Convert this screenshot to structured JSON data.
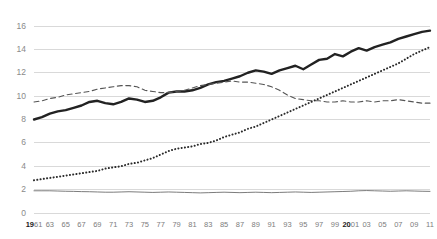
{
  "chart_data": {
    "type": "line",
    "title": "",
    "subtitle": "",
    "xlabel": "",
    "ylabel": "",
    "xlim": [
      1961,
      2011
    ],
    "ylim": [
      0,
      17
    ],
    "yticks": [
      0,
      2,
      4,
      6,
      8,
      10,
      12,
      14,
      16
    ],
    "ytick_labels": [
      "0",
      "2",
      "4",
      "6",
      "8",
      "10",
      "12",
      "14",
      "16"
    ],
    "grid": true,
    "grid_axis": "y",
    "legend": "none",
    "xticks": [
      1961,
      1963,
      1965,
      1967,
      1969,
      1971,
      1973,
      1975,
      1977,
      1979,
      1981,
      1983,
      1985,
      1987,
      1989,
      1991,
      1993,
      1995,
      1997,
      1999,
      2001,
      2003,
      2005,
      2007,
      2009,
      2011
    ],
    "xtick_labels": [
      "1961",
      "63",
      "65",
      "67",
      "69",
      "71",
      "73",
      "75",
      "77",
      "79",
      "81",
      "83",
      "85",
      "87",
      "89",
      "91",
      "93",
      "95",
      "97",
      "99",
      "2001",
      "03",
      "05",
      "07",
      "09",
      "11"
    ],
    "x": [
      1961,
      1962,
      1963,
      1964,
      1965,
      1966,
      1967,
      1968,
      1969,
      1970,
      1971,
      1972,
      1973,
      1974,
      1975,
      1976,
      1977,
      1978,
      1979,
      1980,
      1981,
      1982,
      1983,
      1984,
      1985,
      1986,
      1987,
      1988,
      1989,
      1990,
      1991,
      1992,
      1993,
      1994,
      1995,
      1996,
      1997,
      1998,
      1999,
      2000,
      2001,
      2002,
      2003,
      2004,
      2005,
      2006,
      2007,
      2008,
      2009,
      2010,
      2011
    ],
    "series": [
      {
        "name": "series-solid-bold",
        "style": "solid",
        "width": 2.4,
        "color": "#222222",
        "values": [
          8.0,
          8.2,
          8.5,
          8.7,
          8.8,
          9.0,
          9.2,
          9.5,
          9.6,
          9.4,
          9.3,
          9.5,
          9.8,
          9.7,
          9.5,
          9.6,
          9.9,
          10.3,
          10.4,
          10.4,
          10.5,
          10.7,
          11.0,
          11.2,
          11.3,
          11.5,
          11.7,
          12.0,
          12.2,
          12.1,
          11.9,
          12.2,
          12.4,
          12.6,
          12.3,
          12.7,
          13.1,
          13.2,
          13.6,
          13.4,
          13.8,
          14.1,
          13.9,
          14.2,
          14.4,
          14.6,
          14.9,
          15.1,
          15.3,
          15.5,
          15.6
        ]
      },
      {
        "name": "series-dashed",
        "style": "dashed",
        "width": 1.1,
        "color": "#555555",
        "values": [
          9.5,
          9.6,
          9.8,
          9.9,
          10.1,
          10.2,
          10.3,
          10.4,
          10.6,
          10.7,
          10.8,
          10.9,
          10.9,
          10.8,
          10.5,
          10.4,
          10.3,
          10.3,
          10.4,
          10.5,
          10.7,
          10.9,
          11.0,
          11.1,
          11.2,
          11.3,
          11.2,
          11.2,
          11.1,
          11.0,
          10.8,
          10.5,
          10.1,
          9.8,
          9.7,
          9.6,
          9.6,
          9.5,
          9.5,
          9.6,
          9.5,
          9.5,
          9.6,
          9.5,
          9.6,
          9.6,
          9.7,
          9.6,
          9.5,
          9.4,
          9.4
        ]
      },
      {
        "name": "series-dotted",
        "style": "dotted",
        "width": 2.0,
        "color": "#2a2a2a",
        "values": [
          2.8,
          2.9,
          3.0,
          3.1,
          3.2,
          3.3,
          3.4,
          3.5,
          3.6,
          3.8,
          3.9,
          4.0,
          4.2,
          4.3,
          4.5,
          4.7,
          5.0,
          5.3,
          5.5,
          5.6,
          5.7,
          5.9,
          6.0,
          6.2,
          6.5,
          6.7,
          6.9,
          7.2,
          7.4,
          7.7,
          8.0,
          8.3,
          8.6,
          8.9,
          9.2,
          9.5,
          9.8,
          10.1,
          10.4,
          10.7,
          11.0,
          11.3,
          11.6,
          11.9,
          12.2,
          12.5,
          12.8,
          13.2,
          13.6,
          13.9,
          14.2
        ]
      },
      {
        "name": "series-flat-thin",
        "style": "solid",
        "width": 0.8,
        "color": "#5a5a5a",
        "values": [
          1.9,
          1.9,
          1.9,
          1.88,
          1.86,
          1.85,
          1.83,
          1.82,
          1.8,
          1.78,
          1.78,
          1.8,
          1.82,
          1.8,
          1.78,
          1.76,
          1.78,
          1.8,
          1.78,
          1.76,
          1.74,
          1.72,
          1.74,
          1.76,
          1.78,
          1.76,
          1.74,
          1.76,
          1.78,
          1.76,
          1.74,
          1.76,
          1.78,
          1.8,
          1.78,
          1.76,
          1.78,
          1.8,
          1.82,
          1.84,
          1.86,
          1.9,
          1.92,
          1.9,
          1.88,
          1.86,
          1.88,
          1.9,
          1.88,
          1.86,
          1.85
        ]
      }
    ]
  },
  "axes": {
    "grid_color": "#d9d9d9",
    "ytick_color": "#8a8a8a",
    "xtick_color": "#7d7d7d"
  }
}
